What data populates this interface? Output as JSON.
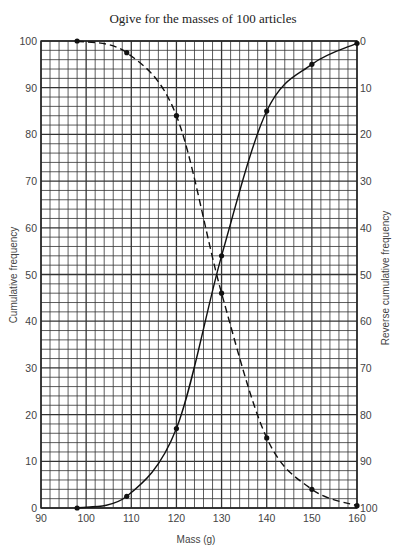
{
  "chart_data": {
    "type": "line",
    "title": "Ogive for the masses of 100 articles",
    "xlabel": "Mass (g)",
    "ylabel": "Cumulative frequency",
    "y2label": "Reverse cumulative frequency",
    "xlim": [
      90,
      160
    ],
    "ylim": [
      0,
      100
    ],
    "y2lim": [
      100,
      0
    ],
    "x_ticks": [
      90,
      100,
      110,
      120,
      130,
      140,
      150,
      160
    ],
    "y_ticks": [
      0,
      10,
      20,
      30,
      40,
      50,
      60,
      70,
      80,
      90,
      100
    ],
    "y2_ticks": [
      0,
      10,
      20,
      30,
      40,
      50,
      60,
      70,
      80,
      90,
      100
    ],
    "grid": true,
    "grid_minor_x": 2,
    "grid_minor_y": 2,
    "legend": "none",
    "series": [
      {
        "name": "Cumulative frequency",
        "axis": "left",
        "style": "solid",
        "x": [
          98,
          109,
          120,
          130,
          140,
          150,
          160
        ],
        "values": [
          0,
          2.5,
          17,
          54,
          85,
          95,
          99.5
        ]
      },
      {
        "name": "Reverse cumulative frequency",
        "axis": "right",
        "style": "dashed",
        "x": [
          98,
          109,
          120,
          130,
          140,
          150,
          160
        ],
        "values": [
          0,
          2.5,
          16,
          54,
          85,
          96,
          99.5
        ]
      }
    ]
  }
}
